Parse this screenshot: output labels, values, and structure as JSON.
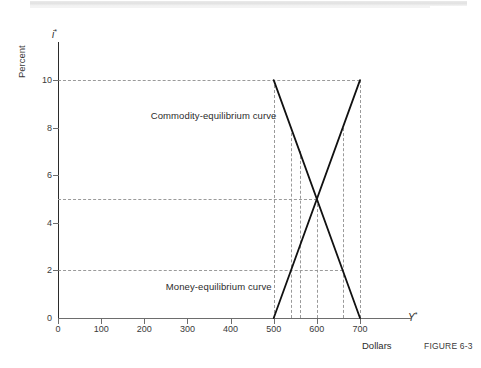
{
  "figure": {
    "caption": "FIGURE 6-3",
    "x_axis_unit_label": "Dollars",
    "y_axis_unit_label": "Percent",
    "x_axis_variable": "Y",
    "x_axis_variable_sup": "*",
    "y_axis_variable": "i",
    "y_axis_variable_sup": "*"
  },
  "chart_data": {
    "type": "line",
    "title": "",
    "xlabel": "Dollars",
    "ylabel": "Percent",
    "xlim": [
      0,
      780
    ],
    "ylim": [
      0,
      11.6
    ],
    "grid": false,
    "legend_position": "inline-annotation",
    "x_ticks": [
      0,
      100,
      200,
      300,
      400,
      500,
      600,
      700
    ],
    "x_tick_labels": [
      "0",
      "100",
      "200",
      "300",
      "400",
      "500",
      "600",
      "700"
    ],
    "y_ticks": [
      0,
      2,
      4,
      6,
      8,
      10
    ],
    "y_tick_labels": [
      "0",
      "2",
      "4",
      "6",
      "8",
      "10"
    ],
    "series": [
      {
        "name": "Commodity-equilibrium curve",
        "points": [
          [
            500,
            10
          ],
          [
            700,
            0
          ]
        ],
        "slope": "negative",
        "color": "#111111"
      },
      {
        "name": "Money-equilibrium curve",
        "points": [
          [
            500,
            0
          ],
          [
            700,
            10
          ]
        ],
        "slope": "positive",
        "color": "#111111"
      }
    ],
    "intersection": {
      "x": 600,
      "y": 5
    },
    "annotations": [
      {
        "text": "Commodity-equilibrium curve",
        "x": 215,
        "y": 8.5
      },
      {
        "text": "Money-equilibrium curve",
        "x": 250,
        "y": 1.3
      }
    ],
    "guide_lines": {
      "horizontal": [
        {
          "y": 10,
          "from_x": 0,
          "to_x": 700
        },
        {
          "y": 5,
          "from_x": 0,
          "to_x": 600
        },
        {
          "y": 2,
          "from_x": 0,
          "to_x": 660
        }
      ],
      "vertical": [
        {
          "x": 500,
          "from_y": 0,
          "to_y": 10
        },
        {
          "x": 540,
          "from_y": 0,
          "to_y": 8
        },
        {
          "x": 560,
          "from_y": 0,
          "to_y": 7
        },
        {
          "x": 600,
          "from_y": 0,
          "to_y": 5
        },
        {
          "x": 660,
          "from_y": 0,
          "to_y": 8
        },
        {
          "x": 700,
          "from_y": 0,
          "to_y": 10
        }
      ]
    }
  }
}
